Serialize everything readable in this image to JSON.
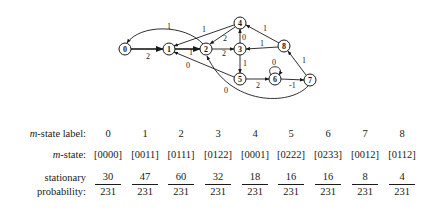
{
  "graph": {
    "nodes": [
      {
        "id": "0",
        "x": 125,
        "y": 49
      },
      {
        "id": "1",
        "x": 169,
        "y": 49
      },
      {
        "id": "2",
        "x": 206,
        "y": 49
      },
      {
        "id": "3",
        "x": 240,
        "y": 49
      },
      {
        "id": "4",
        "x": 240,
        "y": 23
      },
      {
        "id": "5",
        "x": 240,
        "y": 79
      },
      {
        "id": "6",
        "x": 275,
        "y": 79
      },
      {
        "id": "7",
        "x": 310,
        "y": 80
      },
      {
        "id": "8",
        "x": 284,
        "y": 46
      }
    ],
    "edges": [
      {
        "from": "0",
        "to": "1",
        "label": "2"
      },
      {
        "from": "1",
        "to": "2",
        "label": "1"
      },
      {
        "from": "2",
        "to": "3",
        "label": "2"
      },
      {
        "from": "3",
        "to": "4",
        "label": "0"
      },
      {
        "from": "4",
        "to": "1",
        "label": "1"
      },
      {
        "from": "4",
        "to": "2",
        "label": "2"
      },
      {
        "from": "3",
        "to": "5",
        "label": "1"
      },
      {
        "from": "8",
        "to": "3",
        "label": "1"
      },
      {
        "from": "8",
        "to": "4",
        "label": "1"
      },
      {
        "from": "5",
        "to": "6",
        "label": "2"
      },
      {
        "from": "6",
        "to": "6",
        "label": "0"
      },
      {
        "from": "6",
        "to": "7",
        "label": "-1"
      },
      {
        "from": "7",
        "to": "8",
        "label": "1"
      },
      {
        "from": "5",
        "to": "1",
        "label": "0"
      },
      {
        "from": "7",
        "to": "2",
        "label": "0"
      },
      {
        "from": "2",
        "to": "0",
        "label": "1"
      }
    ]
  },
  "table": {
    "row_labels": {
      "label_prefix": "m",
      "label_suffix": "-state label:",
      "state_prefix": "m",
      "state_suffix": "-state:",
      "prob_line1": "stationary",
      "prob_line2": "probability:"
    },
    "columns": [
      {
        "label": "0",
        "state": "[0000]",
        "num": "30",
        "den": "231"
      },
      {
        "label": "1",
        "state": "[0011]",
        "num": "47",
        "den": "231"
      },
      {
        "label": "2",
        "state": "[0111]",
        "num": "60",
        "den": "231"
      },
      {
        "label": "3",
        "state": "[0122]",
        "num": "32",
        "den": "231"
      },
      {
        "label": "4",
        "state": "[0001]",
        "num": "18",
        "den": "231"
      },
      {
        "label": "5",
        "state": "[0222]",
        "num": "16",
        "den": "231"
      },
      {
        "label": "6",
        "state": "[0233]",
        "num": "16",
        "den": "231"
      },
      {
        "label": "7",
        "state": "[0012]",
        "num": "8",
        "den": "231"
      },
      {
        "label": "8",
        "state": "[0112]",
        "num": "4",
        "den": "231"
      }
    ]
  }
}
